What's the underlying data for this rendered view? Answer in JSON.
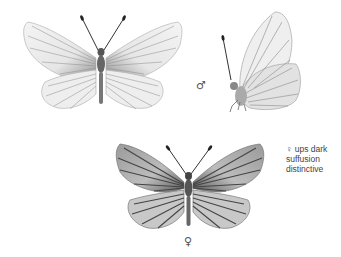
{
  "plate": {
    "figures": [
      {
        "id": "male-upperside",
        "view": "upperside, wings open",
        "sex": "male"
      },
      {
        "id": "male-underside",
        "view": "underside, wings closed, side view",
        "sex": "male"
      },
      {
        "id": "female-upperside",
        "view": "upperside, wings open",
        "sex": "female"
      }
    ],
    "male_symbol": "♂",
    "female_symbol": "♀",
    "note": {
      "lines": [
        "♀ ups dark",
        "suffusion",
        "distinctive"
      ]
    },
    "colors": {
      "background": "#ffffff",
      "ink": "#333333",
      "veins_male": "#8a8a8a",
      "veins_female": "#555555"
    }
  }
}
